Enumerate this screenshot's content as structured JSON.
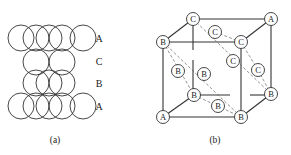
{
  "figure": {
    "panel_a": {
      "caption": "(a)",
      "layers": [
        {
          "label": "A",
          "y": 38
        },
        {
          "label": "C",
          "y": 61
        },
        {
          "label": "B",
          "y": 83
        },
        {
          "label": "A",
          "y": 106
        }
      ]
    },
    "panel_b": {
      "caption": "(b)",
      "atoms": [
        {
          "label": "C",
          "x": 193,
          "y": 19
        },
        {
          "label": "A",
          "x": 271,
          "y": 19
        },
        {
          "label": "B",
          "x": 163,
          "y": 42
        },
        {
          "label": "C",
          "x": 241,
          "y": 42
        },
        {
          "label": "C",
          "x": 215,
          "y": 32
        },
        {
          "label": "C",
          "x": 233,
          "y": 61
        },
        {
          "label": "C",
          "x": 258,
          "y": 70
        },
        {
          "label": "B",
          "x": 178,
          "y": 71
        },
        {
          "label": "B",
          "x": 204,
          "y": 74
        },
        {
          "label": "B",
          "x": 194,
          "y": 95
        },
        {
          "label": "B",
          "x": 271,
          "y": 94
        },
        {
          "label": "B",
          "x": 218,
          "y": 106
        },
        {
          "label": "A",
          "x": 163,
          "y": 117
        },
        {
          "label": "B",
          "x": 241,
          "y": 117
        }
      ]
    }
  }
}
